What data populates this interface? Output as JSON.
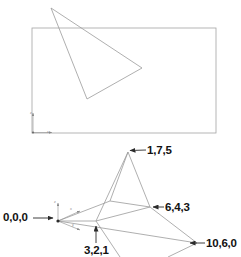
{
  "figure": {
    "title": "",
    "stroke_color": "#9a9a9a",
    "label_color": "#121212",
    "background": "#ffffff"
  },
  "top_panel": {
    "name": "viewport-rectangle-with-triangle",
    "rectangle": {
      "x": 32,
      "y": 28,
      "width": 184,
      "height": 105
    },
    "triangle_points": "51,8 87,99 142,68",
    "axis_marker": {
      "origin_x": 33,
      "origin_y": 132,
      "z_label": "z",
      "x_label": "x"
    }
  },
  "bottom_panel": {
    "name": "three-d-wireframe-pyramid",
    "origin": {
      "x": 58,
      "y": 221
    },
    "axis_labels": {
      "z": "z",
      "x": "x",
      "y": "y"
    },
    "vertices": {
      "apex": {
        "label": "1,7,5",
        "x": 128,
        "y": 152
      },
      "right": {
        "label": "6,4,3",
        "x": 150,
        "y": 207
      },
      "front": {
        "label": "3,2,1",
        "x": 96,
        "y": 221
      },
      "far_right": {
        "label": "10,6,0",
        "x": 197,
        "y": 243
      },
      "left": {
        "x": 110,
        "y": 201
      },
      "origin": {
        "label": "0,0,0",
        "x": 58,
        "y": 221
      }
    }
  },
  "labels": {
    "apex": "1,7,5",
    "right": "6,4,3",
    "far_right": "10,6,0",
    "origin": "0,0,0",
    "front": "3,2,1"
  },
  "axis_tags": {
    "top_z": "z",
    "top_x": "x",
    "main_z": "z",
    "main_x": "x",
    "main_y": "y"
  }
}
